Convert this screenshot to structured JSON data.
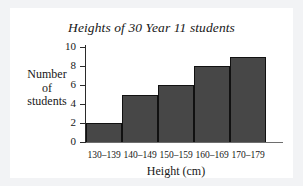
{
  "chart_data": {
    "type": "bar",
    "title": "Heights of 30 Year 11 students",
    "xlabel": "Height (cm)",
    "ylabel_lines": [
      "Number",
      "of",
      "students"
    ],
    "ylabel": "Number of students",
    "categories": [
      "130–139",
      "140–149",
      "150–159",
      "160–169",
      "170–179"
    ],
    "values": [
      2,
      5,
      6,
      8,
      9
    ],
    "yticks": [
      10,
      8,
      6,
      4,
      2,
      0
    ],
    "ylim": [
      0,
      10
    ],
    "grid": false,
    "legend": "none",
    "bar_color": "#474747",
    "bar_edge_color": "#111111",
    "axis_color": "#2b2b2b",
    "text_color": "#171717",
    "background_color": "#ffffff",
    "page_background_color": "#f2f3f5",
    "total": 30
  }
}
